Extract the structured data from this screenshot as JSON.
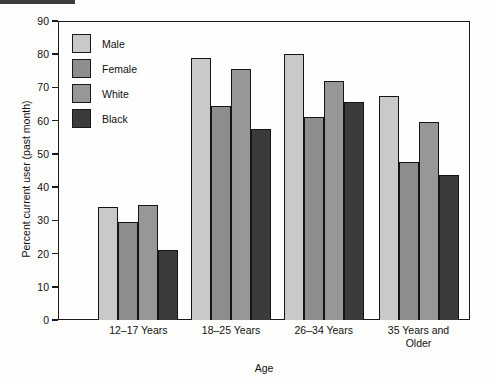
{
  "chart_data": {
    "type": "bar",
    "title": "",
    "xlabel": "Age",
    "ylabel": "Percent current user (past month)",
    "categories": [
      "12–17 Years",
      "18–25 Years",
      "26–34 Years",
      "35 Years and Older"
    ],
    "category_lines": [
      [
        "12–17 Years"
      ],
      [
        "18–25 Years"
      ],
      [
        "26–34 Years"
      ],
      [
        "35 Years and",
        "Older"
      ]
    ],
    "series": [
      {
        "name": "Male",
        "color": "#c9c9c7",
        "values": [
          34.0,
          79.0,
          80.0,
          67.5
        ]
      },
      {
        "name": "Female",
        "color": "#8d8d8b",
        "values": [
          29.5,
          64.5,
          61.0,
          47.5
        ]
      },
      {
        "name": "White",
        "color": "#979795",
        "values": [
          34.5,
          75.5,
          72.0,
          59.5
        ]
      },
      {
        "name": "Black",
        "color": "#3b3b3a",
        "values": [
          21.0,
          57.5,
          65.5,
          43.5
        ]
      }
    ],
    "ylim": [
      0,
      90
    ],
    "yticks": [
      0,
      10,
      20,
      30,
      40,
      50,
      60,
      70,
      80,
      90
    ],
    "ytick_labels": [
      "0",
      "10",
      "20",
      "30",
      "40",
      "50",
      "60",
      "70",
      "80",
      "90"
    ],
    "grid": false,
    "legend_position": "top-left",
    "frame_color": "#1a1a1a",
    "bar_edge_color": "#151515",
    "background": "#fdfdfc"
  }
}
